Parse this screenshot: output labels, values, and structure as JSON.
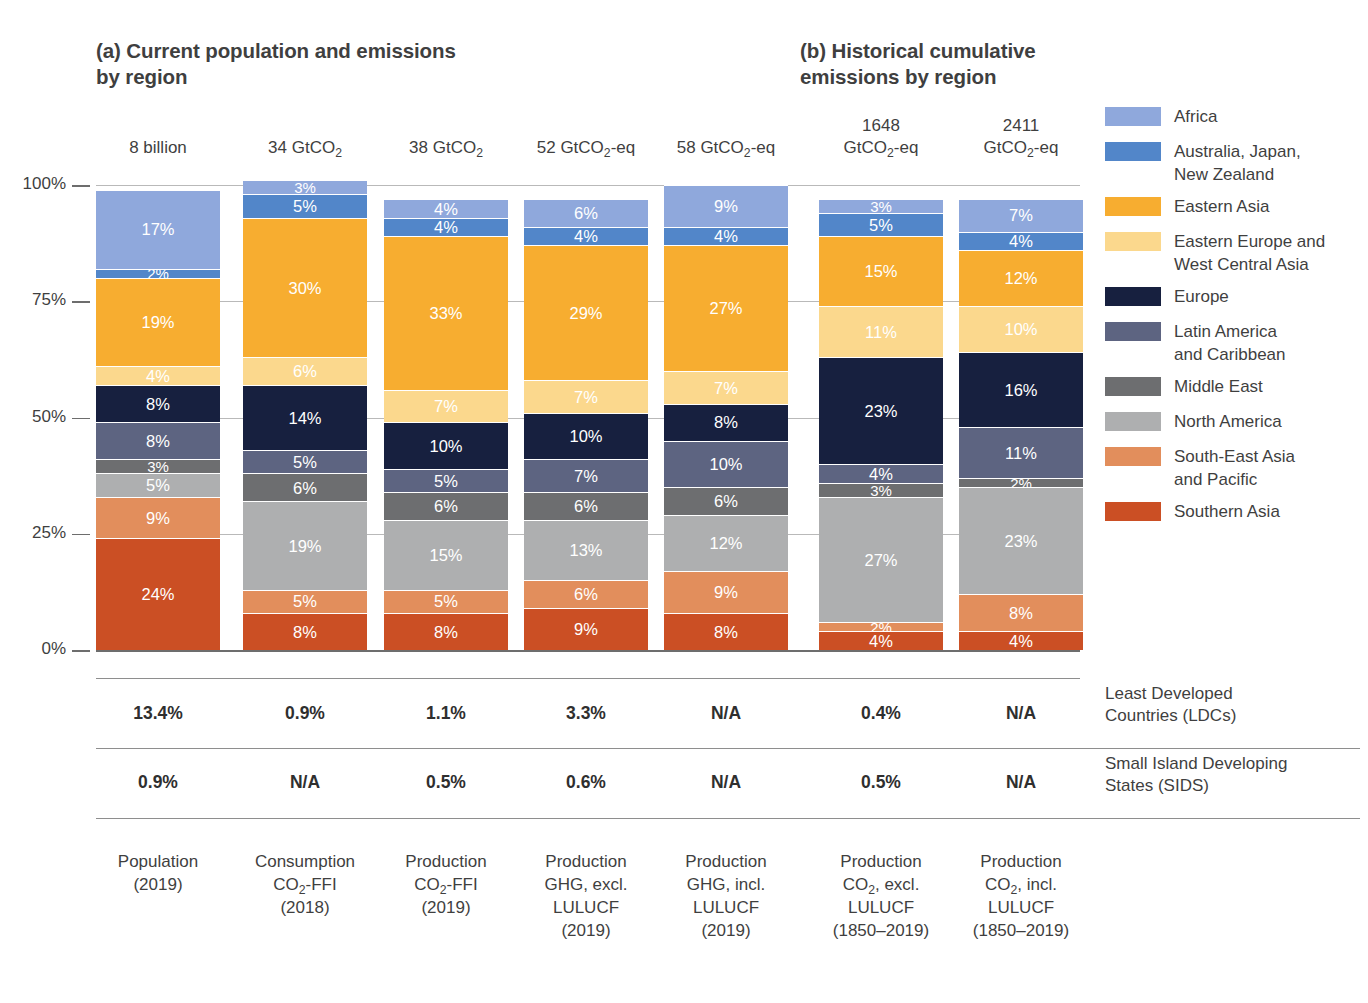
{
  "panels": {
    "a": "(a) Current population and emissions by region",
    "b": "(b) Historical cumulative emissions by region"
  },
  "yaxis": {
    "ticks": [
      "100%",
      "75%",
      "50%",
      "25%",
      "0%"
    ]
  },
  "table_rows": [
    {
      "label_line1": "Least Developed",
      "label_line2": "Countries (LDCs)",
      "values": [
        "13.4%",
        "0.9%",
        "1.1%",
        "3.3%",
        "N/A",
        "0.4%",
        "N/A"
      ]
    },
    {
      "label_line1": "Small Island Developing",
      "label_line2": "States (SIDS)",
      "values": [
        "0.9%",
        "N/A",
        "0.5%",
        "0.6%",
        "N/A",
        "0.5%",
        "N/A"
      ]
    }
  ],
  "legend": [
    {
      "name": "Africa",
      "color": "#8FA8DC"
    },
    {
      "name": "Australia, Japan,\nNew Zealand",
      "color": "#5286C9"
    },
    {
      "name": "Eastern Asia",
      "color": "#F7AD30"
    },
    {
      "name": "Eastern Europe and\nWest Central Asia",
      "color": "#FBD88D"
    },
    {
      "name": "Europe",
      "color": "#17203F"
    },
    {
      "name": "Latin America\nand Caribbean",
      "color": "#5D6481"
    },
    {
      "name": "Middle East",
      "color": "#6D6E70"
    },
    {
      "name": "North America",
      "color": "#AEAFB0"
    },
    {
      "name": "South-East Asia\nand Pacific",
      "color": "#E28E5C"
    },
    {
      "name": "Southern Asia",
      "color": "#CB4F24"
    }
  ],
  "chart_data": {
    "type": "bar",
    "xlabel": "",
    "ylabel": "Share of global total (%)",
    "ylim": [
      0,
      100
    ],
    "grid": true,
    "stacked": true,
    "legend_position": "right",
    "ytick_labels": [
      "0%",
      "25%",
      "50%",
      "75%",
      "100%"
    ],
    "series": [
      {
        "name": "Africa",
        "color": "#8FA8DC",
        "values": [
          17,
          3,
          4,
          6,
          9,
          3,
          7
        ]
      },
      {
        "name": "Australia, Japan, New Zealand",
        "color": "#5286C9",
        "values": [
          2,
          5,
          4,
          4,
          4,
          5,
          4
        ]
      },
      {
        "name": "Eastern Asia",
        "color": "#F7AD30",
        "values": [
          19,
          30,
          33,
          29,
          27,
          15,
          12
        ]
      },
      {
        "name": "Eastern Europe and West Central Asia",
        "color": "#FBD88D",
        "values": [
          4,
          6,
          7,
          7,
          7,
          11,
          10
        ]
      },
      {
        "name": "Europe",
        "color": "#17203F",
        "values": [
          8,
          14,
          10,
          10,
          8,
          23,
          16
        ]
      },
      {
        "name": "Latin America and Caribbean",
        "color": "#5D6481",
        "values": [
          8,
          5,
          5,
          7,
          10,
          4,
          11
        ]
      },
      {
        "name": "Middle East",
        "color": "#6D6E70",
        "values": [
          3,
          6,
          6,
          6,
          6,
          3,
          2
        ]
      },
      {
        "name": "North America",
        "color": "#AEAFB0",
        "values": [
          5,
          19,
          15,
          13,
          12,
          27,
          23
        ]
      },
      {
        "name": "South-East Asia and Pacific",
        "color": "#E28E5C",
        "values": [
          9,
          5,
          5,
          6,
          9,
          2,
          8
        ]
      },
      {
        "name": "Southern Asia",
        "color": "#CB4F24",
        "values": [
          24,
          8,
          8,
          9,
          8,
          4,
          4
        ]
      }
    ],
    "columns": [
      {
        "panel": "a",
        "total_line1": "8 billion",
        "total_line2": "",
        "cap_lines": [
          "Population",
          "(2019)"
        ],
        "stack_top": 100
      },
      {
        "panel": "a",
        "total_line1": "34 GtCO₂",
        "total_line2": "",
        "cap_lines": [
          "Consumption",
          "CO₂-FFI",
          "(2018)"
        ],
        "stack_top": 100
      },
      {
        "panel": "a",
        "total_line1": "38 GtCO₂",
        "total_line2": "",
        "cap_lines": [
          "Production",
          "CO₂-FFI",
          "(2019)"
        ],
        "stack_top": 97
      },
      {
        "panel": "a",
        "total_line1": "52 GtCO₂-eq",
        "total_line2": "",
        "cap_lines": [
          "Production",
          "GHG, excl.",
          "LULUCF",
          "(2019)"
        ],
        "stack_top": 97
      },
      {
        "panel": "a",
        "total_line1": "58 GtCO₂-eq",
        "total_line2": "",
        "cap_lines": [
          "Production",
          "GHG, incl.",
          "LULUCF",
          "(2019)"
        ],
        "stack_top": 100
      },
      {
        "panel": "b",
        "total_line1": "1648",
        "total_line2": "GtCO₂-eq",
        "cap_lines": [
          "Production",
          "CO₂, excl.",
          "LULUCF",
          "(1850–2019)"
        ],
        "stack_top": 97
      },
      {
        "panel": "b",
        "total_line1": "2411",
        "total_line2": "GtCO₂-eq",
        "cap_lines": [
          "Production",
          "CO₂, incl.",
          "LULUCF",
          "(1850–2019)"
        ],
        "stack_top": 97
      }
    ],
    "categories": [
      "Population (2019)",
      "Consumption CO2-FFI (2018)",
      "Production CO2-FFI (2019)",
      "Production GHG, excl. LULUCF (2019)",
      "Production GHG, incl. LULUCF (2019)",
      "Production CO2, excl. LULUCF (1850-2019)",
      "Production CO2, incl. LULUCF (1850-2019)"
    ]
  }
}
